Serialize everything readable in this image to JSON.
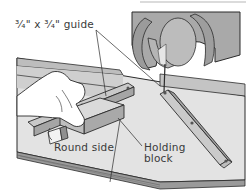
{
  "figure": {
    "labels": {
      "guide": "3/4\" x 3/4\" guide",
      "guide_display": "³⁄₄\" x ³⁄₄\" guide",
      "round_side": "Round side",
      "holding_block": "Holding block"
    },
    "colors": {
      "background": "#ffffff",
      "table": "#dcdcdc",
      "table_edge": "#9a9a9a",
      "saw_body": "#a9a9a9",
      "saw_shadow": "#8c8c8c",
      "wood": "#c8c8c8",
      "outline": "#2b2b2b",
      "text": "#3a3a3a"
    }
  }
}
